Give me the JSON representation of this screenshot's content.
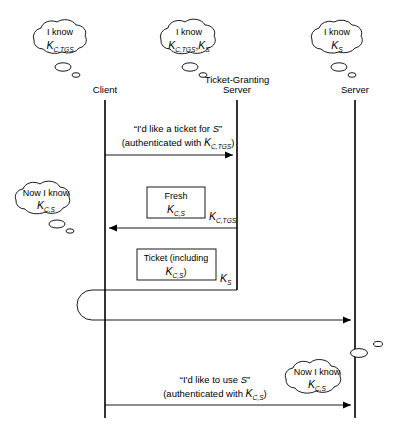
{
  "diagram": {
    "stroke_color": "#000000",
    "background_color": "#ffffff"
  },
  "actors": [
    {
      "id": "client",
      "label": "Client",
      "x": 105
    },
    {
      "id": "tgs",
      "label_line1": "Ticket-Granting",
      "label_line2": "Server",
      "x": 237
    },
    {
      "id": "server",
      "label": "Server",
      "x": 355
    }
  ],
  "clouds": [
    {
      "id": "client-knows",
      "line1": "I know",
      "key_base": "K",
      "key_sub": "C,TGS",
      "cx": 57,
      "cy": 40
    },
    {
      "id": "tgs-knows",
      "line1": "I know",
      "key_base": "K",
      "key_sub": "C,TGS",
      "key_base2": "K",
      "key_sub2": "S",
      "cx": 188,
      "cy": 40
    },
    {
      "id": "server-knows",
      "line1": "I know",
      "key_base": "K",
      "key_sub": "S",
      "cx": 334,
      "cy": 40
    },
    {
      "id": "client-learned",
      "line1": "Now I know",
      "key_base": "K",
      "key_sub": "C,S",
      "cx": 52,
      "cy": 200
    },
    {
      "id": "server-learned",
      "line1": "Now I know",
      "key_base": "K",
      "key_sub": "C,S",
      "cx": 320,
      "cy": 378
    }
  ],
  "messages": [
    {
      "id": "msg-ticket-request",
      "line1_quote": "“I'd like a ticket for S”",
      "line1_pre": "“I'd like a ticket for ",
      "line1_var": "S",
      "line1_post": "”",
      "line2_pre": "(authenticated with ",
      "line2_key_base": "K",
      "line2_key_sub": "C,TGS",
      "line2_post": ")",
      "from": "client",
      "to": "tgs",
      "y": 155,
      "direction": "right"
    },
    {
      "id": "msg-fresh-key",
      "box_line1": "Fresh",
      "box_key_base": "K",
      "box_key_sub": "C,S",
      "outer_key_base": "K",
      "outer_key_sub": "C,TGS",
      "from": "tgs",
      "to": "client",
      "y": 228,
      "direction": "left"
    },
    {
      "id": "msg-ticket",
      "box_line1": "Ticket (including",
      "box_key_base": "K",
      "box_key_sub": "C,S",
      "box_line2_post": ")",
      "outer_key_base": "K",
      "outer_key_sub": "S",
      "from": "tgs",
      "to": "client",
      "y": 290,
      "direction": "loop"
    },
    {
      "id": "msg-service-request",
      "line1_pre": "“I'd like to use ",
      "line1_var": "S",
      "line1_post": "”",
      "line2_pre": "(authenticated with ",
      "line2_key_base": "K",
      "line2_key_sub": "C,S",
      "line2_post": ")",
      "from": "client",
      "to": "server",
      "y": 405,
      "direction": "right"
    }
  ]
}
